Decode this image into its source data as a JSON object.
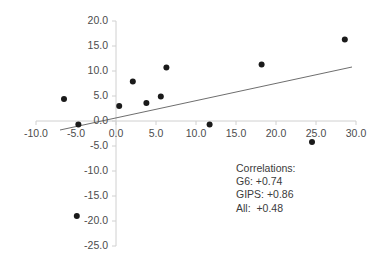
{
  "chart_data": {
    "type": "scatter",
    "title": "",
    "subtitle": "",
    "xlabel": "",
    "ylabel": "",
    "xlim": [
      -10.0,
      30.0
    ],
    "ylim": [
      -25.0,
      20.0
    ],
    "xticks": [
      "-10.0",
      "-5.0",
      "0.0",
      "5.0",
      "10.0",
      "15.0",
      "20.0",
      "25.0",
      "30.0"
    ],
    "yticks": [
      "20.0",
      "15.0",
      "10.0",
      "5.0",
      "0.0",
      "-5.0",
      "-10.0",
      "-15.0",
      "-20.0",
      "-25.0"
    ],
    "xtick_values": [
      -10.0,
      -5.0,
      0.0,
      5.0,
      10.0,
      15.0,
      20.0,
      25.0,
      30.0
    ],
    "ytick_values": [
      20.0,
      15.0,
      10.0,
      5.0,
      0.0,
      -5.0,
      -10.0,
      -15.0,
      -20.0,
      -25.0
    ],
    "grid": false,
    "legend": "none",
    "marker_color": "#1a1a1a",
    "marker_size": 3.0,
    "axis_color": "#d0d0d0",
    "trendline_color": "#6e6e6e",
    "points": [
      {
        "x": -6.5,
        "y": 4.4
      },
      {
        "x": -4.7,
        "y": -0.7
      },
      {
        "x": -4.9,
        "y": -19.0
      },
      {
        "x": 0.4,
        "y": 3.0
      },
      {
        "x": 2.1,
        "y": 7.9
      },
      {
        "x": 3.8,
        "y": 3.6
      },
      {
        "x": 5.6,
        "y": 4.9
      },
      {
        "x": 6.3,
        "y": 10.7
      },
      {
        "x": 11.7,
        "y": -0.7
      },
      {
        "x": 18.2,
        "y": 11.3
      },
      {
        "x": 24.5,
        "y": -4.2
      },
      {
        "x": 28.6,
        "y": 16.3
      }
    ],
    "trendline": {
      "x0": -7.0,
      "y0": -1.8,
      "x1": 29.5,
      "y1": 10.8
    },
    "annotations": {
      "heading": "Correlations:",
      "lines": [
        {
          "label": "G6:",
          "value": "+0.74",
          "text": "G6: +0.74"
        },
        {
          "label": "GIPS:",
          "value": "+0.86",
          "text": "GIPS: +0.86"
        },
        {
          "label": "All:",
          "value": "+0.48",
          "text": "All:  +0.48"
        }
      ]
    }
  }
}
